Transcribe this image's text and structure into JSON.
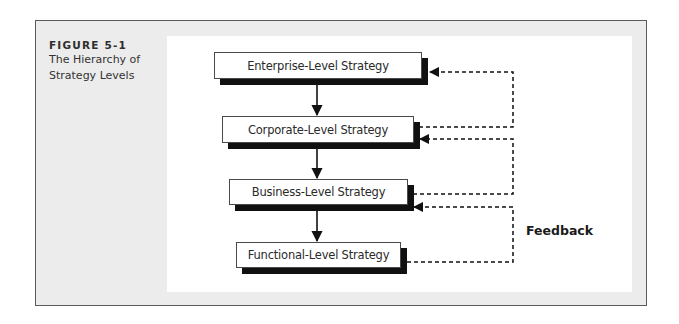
{
  "figure": {
    "number": "FIGURE 5-1",
    "title_line1": "The Hierarchy of",
    "title_line2": "Strategy Levels"
  },
  "diagram": {
    "type": "hierarchy-flow",
    "levels": [
      {
        "label": "Enterprise-Level Strategy"
      },
      {
        "label": "Corporate-Level Strategy"
      },
      {
        "label": "Business-Level Strategy"
      },
      {
        "label": "Functional-Level Strategy"
      }
    ],
    "downward_arrows": [
      {
        "from": "Enterprise-Level Strategy",
        "to": "Corporate-Level Strategy"
      },
      {
        "from": "Corporate-Level Strategy",
        "to": "Business-Level Strategy"
      },
      {
        "from": "Business-Level Strategy",
        "to": "Functional-Level Strategy"
      }
    ],
    "feedback_loops": [
      {
        "from": "Corporate-Level Strategy",
        "to": "Enterprise-Level Strategy",
        "style": "dashed"
      },
      {
        "from": "Business-Level Strategy",
        "to": "Corporate-Level Strategy",
        "style": "dashed"
      },
      {
        "from": "Functional-Level Strategy",
        "to": "Business-Level Strategy",
        "style": "dashed"
      }
    ],
    "feedback_label": "Feedback"
  },
  "colors": {
    "frame_bg": "#ececec",
    "panel_bg": "#ffffff",
    "line": "#1a1a1a"
  }
}
